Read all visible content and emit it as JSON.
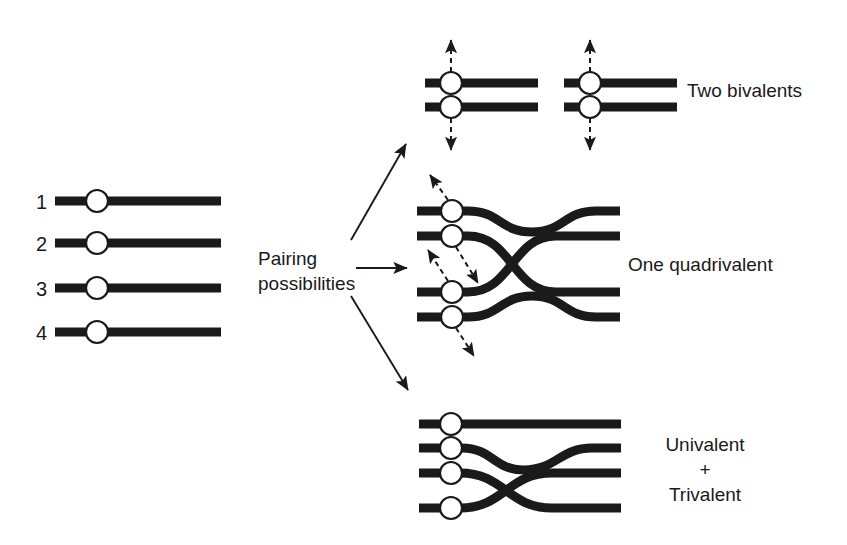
{
  "figure": {
    "background_color": "#ffffff",
    "ink_color": "#1a1a1a",
    "centromere_fill": "#ffffff",
    "width": 847,
    "height": 545
  },
  "input_chromosomes": {
    "caption": "Four homologous chromosomes",
    "labels": [
      "1",
      "2",
      "3",
      "4"
    ],
    "rows": [
      {
        "number": "1",
        "y": 201,
        "x_start": 55,
        "x_end": 221,
        "centromere_x": 97
      },
      {
        "number": "2",
        "y": 243,
        "x_start": 55,
        "x_end": 221,
        "centromere_x": 97
      },
      {
        "number": "3",
        "y": 288,
        "x_start": 55,
        "x_end": 221,
        "centromere_x": 97
      },
      {
        "number": "4",
        "y": 332,
        "x_start": 55,
        "x_end": 221,
        "centromere_x": 97
      }
    ]
  },
  "pairing": {
    "line1": "Pairing",
    "line2": "possibilities",
    "arrow_count": 3,
    "arrow_directions": [
      "up-right",
      "right",
      "down-right"
    ]
  },
  "outcomes": [
    {
      "id": "two-bivalents",
      "label": "Two bivalents",
      "label_x": 687,
      "label_y": 81,
      "bivalent_count": 2,
      "chromosomes_per_bivalent": 2,
      "pull_arrows": [
        "up",
        "down"
      ]
    },
    {
      "id": "one-quadrivalent",
      "label": "One quadrivalent",
      "label_x": 628,
      "label_y": 255,
      "chromosome_count": 4,
      "crossover_count": 1,
      "pull_arrows": [
        "up-left",
        "down-right",
        "up-left",
        "down-right"
      ]
    },
    {
      "id": "univalent-trivalent",
      "label_lines": [
        "Univalent",
        "+",
        "Trivalent"
      ],
      "label_x": 637,
      "label_y": 432,
      "univalent_count": 1,
      "trivalent_count": 1,
      "crossover_count": 1
    }
  ]
}
